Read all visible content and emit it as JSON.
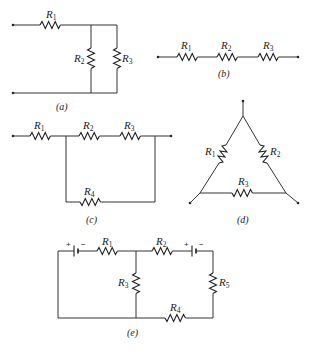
{
  "figure": {
    "panels": [
      {
        "id": "a",
        "caption": "(a)",
        "resistors": [
          {
            "name": "R",
            "sub": "1"
          },
          {
            "name": "R",
            "sub": "2"
          },
          {
            "name": "R",
            "sub": "3"
          }
        ],
        "topology": "R1 in series with (R2 parallel R3)"
      },
      {
        "id": "b",
        "caption": "(b)",
        "resistors": [
          {
            "name": "R",
            "sub": "1"
          },
          {
            "name": "R",
            "sub": "2"
          },
          {
            "name": "R",
            "sub": "3"
          }
        ],
        "topology": "R1, R2, R3 in series"
      },
      {
        "id": "c",
        "caption": "(c)",
        "resistors": [
          {
            "name": "R",
            "sub": "1"
          },
          {
            "name": "R",
            "sub": "2"
          },
          {
            "name": "R",
            "sub": "3"
          },
          {
            "name": "R",
            "sub": "4"
          }
        ],
        "topology": "R1 in series with ((R2+R3) parallel R4)"
      },
      {
        "id": "d",
        "caption": "(d)",
        "resistors": [
          {
            "name": "R",
            "sub": "1"
          },
          {
            "name": "R",
            "sub": "2"
          },
          {
            "name": "R",
            "sub": "3"
          }
        ],
        "topology": "delta (triangle) network"
      },
      {
        "id": "e",
        "caption": "(e)",
        "resistors": [
          {
            "name": "R",
            "sub": "1"
          },
          {
            "name": "R",
            "sub": "2"
          },
          {
            "name": "R",
            "sub": "3"
          },
          {
            "name": "R",
            "sub": "4"
          },
          {
            "name": "R",
            "sub": "5"
          }
        ],
        "batteries": [
          {
            "plus": "+",
            "minus": "−"
          },
          {
            "plus": "+",
            "minus": "−"
          }
        ],
        "topology": "two-loop circuit with two batteries"
      }
    ]
  },
  "colors": {
    "line": "#333333",
    "background": "#ffffff"
  }
}
